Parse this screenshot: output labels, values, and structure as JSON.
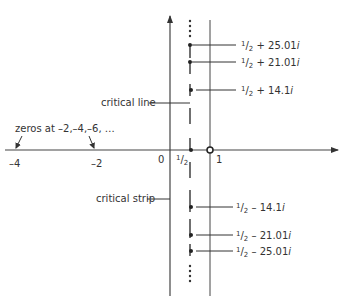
{
  "diagram": {
    "colors": {
      "line": "#333333",
      "axis": "#444444",
      "background": "#ffffff"
    },
    "axes": {
      "real_ticks": [
        {
          "label": "–4",
          "x": 12
        },
        {
          "label": "–2",
          "x": 95
        },
        {
          "label": "0",
          "x": 161
        },
        {
          "label": "1",
          "x": 215
        }
      ],
      "half_label": {
        "num": "1",
        "den": "2"
      }
    },
    "annotations": {
      "trivial_zeros": "zeros at –2,–4,–6, …",
      "critical_line": "critical line",
      "critical_strip": "critical strip"
    },
    "zeros": [
      {
        "label_num": "1",
        "label_den": "2",
        "label_rest": " + 25.01",
        "label_i": "i",
        "y": 45
      },
      {
        "label_num": "1",
        "label_den": "2",
        "label_rest": " + 21.01",
        "label_i": "i",
        "y": 62
      },
      {
        "label_num": "1",
        "label_den": "2",
        "label_rest": " + 14.1",
        "label_i": "i",
        "y": 90
      },
      {
        "label_num": "1",
        "label_den": "2",
        "label_rest": " – 14.1",
        "label_i": "i",
        "y": 207
      },
      {
        "label_num": "1",
        "label_den": "2",
        "label_rest": " – 21.01",
        "label_i": "i",
        "y": 235
      },
      {
        "label_num": "1",
        "label_den": "2",
        "label_rest": " – 25.01",
        "label_i": "i",
        "y": 251
      }
    ]
  }
}
